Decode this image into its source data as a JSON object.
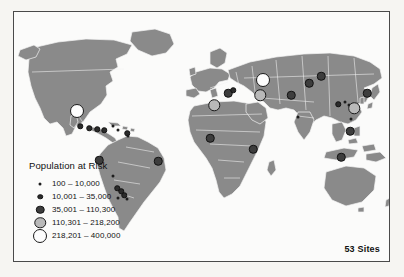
{
  "figure": {
    "kind": "world-map-graduated-symbols",
    "site_count_label": "53 Sites"
  },
  "legend": {
    "title": "Population at Risk",
    "classes": [
      {
        "id": "c1",
        "label": "100 – 10,000",
        "min": 100,
        "max": 10000,
        "symbol": "tiny-black-dot",
        "fill": "#1d1d1d",
        "stroke": "#1d1d1d",
        "diameter_px": 3
      },
      {
        "id": "c2",
        "label": "10,001 – 35,000",
        "min": 10001,
        "max": 35000,
        "symbol": "small-dark-circle",
        "fill": "#2b2b2b",
        "stroke": "#111111",
        "diameter_px": 5.5
      },
      {
        "id": "c3",
        "label": "35,001 – 110,300",
        "min": 35001,
        "max": 110300,
        "symbol": "medium-dark-circle",
        "fill": "#3d3d3d",
        "stroke": "#111111",
        "diameter_px": 8.5
      },
      {
        "id": "c4",
        "label": "110,301 – 218,200",
        "min": 110301,
        "max": 218200,
        "symbol": "large-grey-circle",
        "fill": "#b9b9b9",
        "stroke": "#1a1a1a",
        "diameter_px": 11.5
      },
      {
        "id": "c5",
        "label": "218,201 – 400,000",
        "min": 218201,
        "max": 400000,
        "symbol": "largest-open-circle",
        "fill": "#fdfdfd",
        "stroke": "#1a1a1a",
        "diameter_px": 14
      }
    ]
  },
  "colors": {
    "page_background": "#f6f5f2",
    "frame_border": "#4a4a4a",
    "ocean": "#fbfbfa",
    "land": "#8a8a8a",
    "country_border": "#f4f4f4",
    "text": "#111111"
  },
  "chart_data": {
    "type": "scatter",
    "title": "Population at Risk",
    "xlabel": "",
    "ylabel": "",
    "projection": "world-equirectangular",
    "legend_position": "bottom-left",
    "grid": false,
    "annotations": [
      "53 Sites"
    ],
    "total_sites": 53,
    "size_classes": [
      "100 – 10,000",
      "10,001 – 35,000",
      "35,001 – 110,300",
      "110,301 – 218,200",
      "218,201 – 400,000"
    ],
    "points": [
      {
        "x": 63,
        "y": 99,
        "cls": "c5",
        "region": "north-mexico"
      },
      {
        "x": 66,
        "y": 114,
        "cls": "c2",
        "region": "central-mexico"
      },
      {
        "x": 75,
        "y": 116,
        "cls": "c2",
        "region": "southern-mexico"
      },
      {
        "x": 83,
        "y": 117,
        "cls": "c2",
        "region": "guatemala"
      },
      {
        "x": 90,
        "y": 118,
        "cls": "c2",
        "region": "honduras"
      },
      {
        "x": 99,
        "y": 114,
        "cls": "c1",
        "region": "caribbean"
      },
      {
        "x": 104,
        "y": 118,
        "cls": "c1",
        "region": "caribbean-east"
      },
      {
        "x": 113,
        "y": 121,
        "cls": "c2",
        "region": "venezuela"
      },
      {
        "x": 114,
        "y": 124,
        "cls": "c1",
        "region": "colombia-north"
      },
      {
        "x": 85,
        "y": 148,
        "cls": "c3",
        "region": "peru-north"
      },
      {
        "x": 144,
        "y": 149,
        "cls": "c3",
        "region": "brazil-northeast"
      },
      {
        "x": 99,
        "y": 164,
        "cls": "c1",
        "region": "bolivia"
      },
      {
        "x": 103,
        "y": 176,
        "cls": "c2",
        "region": "andes-argentina"
      },
      {
        "x": 107,
        "y": 179,
        "cls": "c2",
        "region": "argentina-north"
      },
      {
        "x": 110,
        "y": 183,
        "cls": "c2",
        "region": "argentina-central"
      },
      {
        "x": 104,
        "y": 186,
        "cls": "c1",
        "region": "argentina-west"
      },
      {
        "x": 113,
        "y": 187,
        "cls": "c1",
        "region": "argentina-east"
      },
      {
        "x": 200,
        "y": 93,
        "cls": "c4",
        "region": "algeria"
      },
      {
        "x": 214,
        "y": 81,
        "cls": "c3",
        "region": "balkans-turkey"
      },
      {
        "x": 219,
        "y": 78,
        "cls": "c2",
        "region": "caucasus-west"
      },
      {
        "x": 249,
        "y": 68,
        "cls": "c5",
        "region": "russia-volga"
      },
      {
        "x": 246,
        "y": 83,
        "cls": "c4",
        "region": "caspian"
      },
      {
        "x": 277,
        "y": 83,
        "cls": "c3",
        "region": "kazakhstan-east"
      },
      {
        "x": 295,
        "y": 71,
        "cls": "c3",
        "region": "siberia-altai"
      },
      {
        "x": 307,
        "y": 64,
        "cls": "c3",
        "region": "mongolia-north"
      },
      {
        "x": 284,
        "y": 105,
        "cls": "c1",
        "region": "pakistan"
      },
      {
        "x": 196,
        "y": 126,
        "cls": "c3",
        "region": "west-africa"
      },
      {
        "x": 239,
        "y": 137,
        "cls": "c3",
        "region": "east-africa"
      },
      {
        "x": 353,
        "y": 81,
        "cls": "c3",
        "region": "manchuria"
      },
      {
        "x": 324,
        "y": 92,
        "cls": "c2",
        "region": "china-north"
      },
      {
        "x": 331,
        "y": 90,
        "cls": "c1",
        "region": "china-north-east"
      },
      {
        "x": 335,
        "y": 93,
        "cls": "c1",
        "region": "china-central"
      },
      {
        "x": 340,
        "y": 96,
        "cls": "c4",
        "region": "china-southeast"
      },
      {
        "x": 337,
        "y": 107,
        "cls": "c1",
        "region": "china-south"
      },
      {
        "x": 336,
        "y": 119,
        "cls": "c3",
        "region": "south-china-sea"
      },
      {
        "x": 327,
        "y": 145,
        "cls": "c3",
        "region": "java"
      }
    ]
  }
}
